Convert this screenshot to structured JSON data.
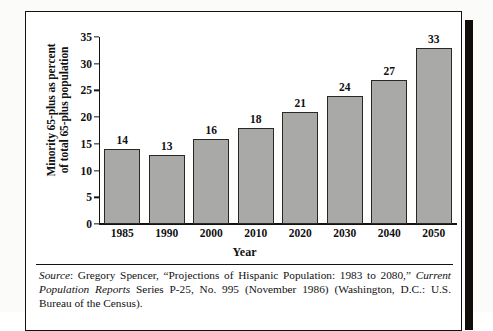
{
  "chart_data": {
    "type": "bar",
    "title": "",
    "xlabel": "Year",
    "ylabel": "Minority 65-plus as percent of total 65-plus population",
    "ylabel_line1": "Minority 65-plus as percent",
    "ylabel_line2": "of total 65-plus population",
    "categories": [
      "1985",
      "1990",
      "2000",
      "2010",
      "2020",
      "2030",
      "2040",
      "2050"
    ],
    "values": [
      14,
      13,
      16,
      18,
      21,
      24,
      27,
      33
    ],
    "ylim": [
      0,
      35
    ],
    "yticks": [
      0,
      5,
      10,
      15,
      20,
      25,
      30,
      35
    ],
    "ytick_labels": [
      "0",
      "5",
      "10",
      "15",
      "20",
      "25",
      "30",
      "35"
    ],
    "grid": false,
    "legend": "none",
    "bar_color": "#a9a9a7",
    "bar_edge_color": "#2b2824",
    "axis_color": "#15120f",
    "data_labels_shown": true
  },
  "source": {
    "label": "Source",
    "colon": ": ",
    "part1": "Gregory Spencer, “Projections of Hispanic Population: 1983 to 2080,” ",
    "italic1": "Current Population Reports",
    "part2": " Series P-25, No. 995 (November 1986) (Washington, D.C.: U.S. Bureau of the Census)."
  }
}
